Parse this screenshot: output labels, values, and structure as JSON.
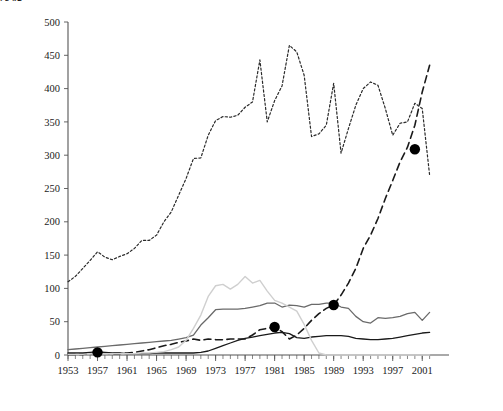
{
  "chart_data": {
    "type": "line",
    "title": "",
    "xlabel": "年份",
    "ylabel": "万吨",
    "xlim": [
      1953,
      2003
    ],
    "ylim": [
      0,
      500
    ],
    "grid": false,
    "legend_position": "right",
    "x_tick_labels": [
      "1953",
      "1957",
      "1961",
      "1965",
      "1969",
      "1973",
      "1977",
      "1981",
      "1985",
      "1989",
      "1993",
      "1997",
      "2001"
    ],
    "x_tick_step": 4,
    "x_minor_tick_step": 1,
    "y_tick_labels": [
      "0",
      "50",
      "100",
      "150",
      "200",
      "250",
      "300",
      "350",
      "400",
      "450",
      "500"
    ],
    "y_tick_step": 50,
    "x": [
      1953,
      1954,
      1955,
      1956,
      1957,
      1958,
      1959,
      1960,
      1961,
      1962,
      1963,
      1964,
      1965,
      1966,
      1967,
      1968,
      1969,
      1970,
      1971,
      1972,
      1973,
      1974,
      1975,
      1976,
      1977,
      1978,
      1979,
      1980,
      1981,
      1982,
      1983,
      1984,
      1985,
      1986,
      1987,
      1988,
      1989,
      1990,
      1991,
      1992,
      1993,
      1994,
      1995,
      1996,
      1997,
      1998,
      1999,
      2000,
      2001,
      2002
    ],
    "series": [
      {
        "name": "中国",
        "legend_label": "中国",
        "color": "#1a1a1a",
        "style": "solid",
        "width": 1.3,
        "values": [
          3,
          3,
          3,
          4,
          5,
          4,
          3,
          3,
          2,
          2,
          2,
          2,
          3,
          3,
          3,
          3,
          3,
          3,
          4,
          6,
          10,
          14,
          18,
          22,
          25,
          27,
          29,
          31,
          33,
          34,
          32,
          26,
          25,
          27,
          28,
          29,
          29,
          29,
          28,
          25,
          24,
          23,
          23,
          24,
          25,
          27,
          29,
          31,
          33,
          34
        ]
      },
      {
        "name": "美国",
        "legend_label": "美国",
        "color": "#2a2a2a",
        "style": "dotted",
        "width": 1.2,
        "values": [
          110,
          118,
          130,
          142,
          155,
          147,
          143,
          148,
          152,
          160,
          172,
          172,
          180,
          200,
          215,
          240,
          265,
          295,
          296,
          330,
          352,
          358,
          357,
          360,
          372,
          380,
          443,
          350,
          382,
          404,
          465,
          455,
          420,
          328,
          332,
          345,
          408,
          303,
          340,
          375,
          400,
          410,
          405,
          370,
          330,
          348,
          350,
          378,
          370,
          270
        ]
      },
      {
        "name": "英国",
        "legend_label": "英国",
        "color": "#1a1a1a",
        "style": "dashed",
        "width": 1.6,
        "values": [
          1,
          1,
          1,
          2,
          4,
          3,
          2,
          2,
          3,
          4,
          6,
          8,
          11,
          14,
          16,
          19,
          21,
          24,
          22,
          24,
          23,
          23,
          24,
          24,
          24,
          30,
          38,
          40,
          42,
          35,
          24,
          30,
          40,
          52,
          62,
          70,
          75,
          90,
          108,
          130,
          160,
          180,
          205,
          235,
          262,
          290,
          312,
          345,
          395,
          435
        ]
      },
      {
        "name": "德国",
        "legend_label": "德国",
        "color": "#6a6a6a",
        "style": "solid",
        "width": 1.3,
        "values": [
          8,
          9,
          10,
          11,
          12,
          13,
          14,
          15,
          16,
          17,
          18,
          19,
          20,
          21,
          22,
          24,
          26,
          30,
          45,
          56,
          68,
          69,
          69,
          69,
          70,
          72,
          74,
          78,
          78,
          72,
          75,
          74,
          72,
          76,
          76,
          78,
          78,
          72,
          70,
          58,
          50,
          48,
          56,
          55,
          56,
          58,
          62,
          64,
          52,
          64
        ]
      },
      {
        "name": "日本",
        "legend_label": "日本",
        "color": "#cfcfcf",
        "style": "solid",
        "width": 1.4,
        "values": [
          1,
          1,
          1,
          2,
          2,
          2,
          2,
          2,
          2,
          2,
          3,
          3,
          4,
          5,
          8,
          12,
          22,
          40,
          60,
          88,
          104,
          106,
          99,
          106,
          118,
          108,
          112,
          96,
          82,
          78,
          72,
          66,
          46,
          22,
          3,
          0,
          0,
          0,
          0,
          0,
          0,
          0,
          0,
          0,
          0,
          0,
          0,
          0,
          0,
          0
        ]
      }
    ],
    "markers": [
      {
        "series": "英国",
        "x": 1957,
        "y": 4
      },
      {
        "series": "英国",
        "x": 1981,
        "y": 42
      },
      {
        "series": "英国",
        "x": 1989,
        "y": 75
      },
      {
        "series": "英国",
        "x": 2000,
        "y": 309
      }
    ],
    "marker_color": "#000000",
    "marker_radius": 5.2
  },
  "legend": {
    "items": [
      {
        "label": "中国"
      },
      {
        "label": "美国"
      },
      {
        "label": "英国"
      },
      {
        "label": "德国"
      },
      {
        "label": "日本"
      }
    ]
  }
}
